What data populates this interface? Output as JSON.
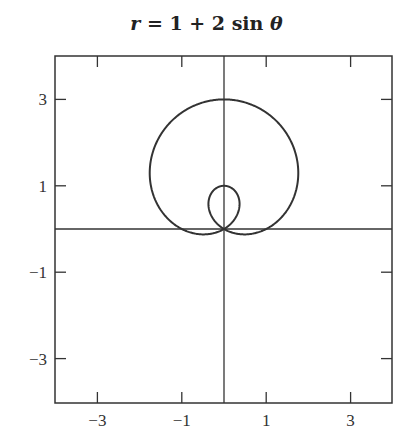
{
  "chart_data": {
    "type": "line",
    "subtype": "polar-curve",
    "title": "r = 1 + 2 sin θ",
    "title_parts": {
      "var": "r",
      "rest": " = 1 + 2 sin ",
      "theta": "θ"
    },
    "equation": {
      "a": 1,
      "b": 2,
      "func": "sin"
    },
    "xlabel": "",
    "ylabel": "",
    "xlim": [
      -4,
      4
    ],
    "ylim": [
      -4,
      4
    ],
    "xticks": [
      -3,
      -1,
      1,
      3
    ],
    "yticks": [
      3,
      1,
      -1,
      -3
    ],
    "xtick_labels": [
      "−3",
      "−1",
      "1",
      "3"
    ],
    "ytick_labels": [
      "3",
      "1",
      "−1",
      "−3"
    ],
    "grid": false,
    "legend": null,
    "axes_through_origin": true,
    "features": {
      "outer_loop_top": [
        0,
        3
      ],
      "inner_loop_top": [
        0,
        1
      ],
      "passes_through_origin": true,
      "max_width_x": [
        -1.3,
        1.3
      ]
    },
    "line_color": "#333333"
  }
}
